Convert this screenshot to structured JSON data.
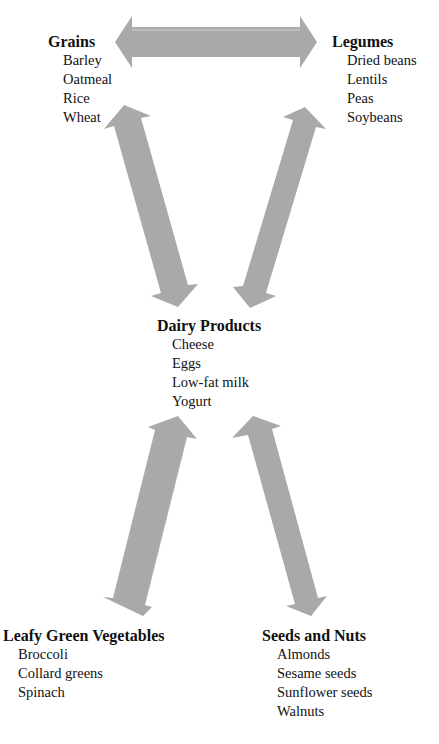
{
  "diagram": {
    "arrow_color": "#a9a9a9",
    "groups": {
      "grains": {
        "title": "Grains",
        "items": [
          "Barley",
          "Oatmeal",
          "Rice",
          "Wheat"
        ]
      },
      "legumes": {
        "title": "Legumes",
        "items": [
          "Dried beans",
          "Lentils",
          "Peas",
          "Soybeans"
        ]
      },
      "dairy": {
        "title": "Dairy Products",
        "items": [
          "Cheese",
          "Eggs",
          "Low-fat milk",
          "Yogurt"
        ]
      },
      "leafy": {
        "title": "Leafy Green Vegetables",
        "items": [
          "Broccoli",
          "Collard greens",
          "Spinach"
        ]
      },
      "seeds": {
        "title": "Seeds and Nuts",
        "items": [
          "Almonds",
          "Sesame seeds",
          "Sunflower seeds",
          "Walnuts"
        ]
      }
    },
    "connections": [
      {
        "from": "Grains",
        "to": "Legumes",
        "type": "double-arrow"
      },
      {
        "from": "Grains",
        "to": "Dairy Products",
        "type": "double-arrow"
      },
      {
        "from": "Legumes",
        "to": "Dairy Products",
        "type": "double-arrow"
      },
      {
        "from": "Dairy Products",
        "to": "Leafy Green Vegetables",
        "type": "double-arrow"
      },
      {
        "from": "Dairy Products",
        "to": "Seeds and Nuts",
        "type": "double-arrow"
      }
    ]
  }
}
